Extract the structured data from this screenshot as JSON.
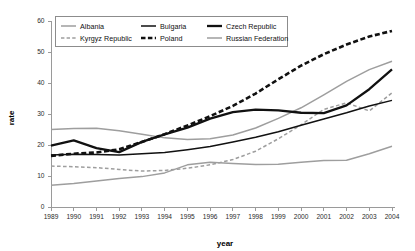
{
  "chart_data": {
    "type": "line",
    "title": "",
    "xlabel": "year",
    "ylabel": "rate",
    "grid": false,
    "legend_position": "top-inside",
    "xlim": [
      1989,
      2004
    ],
    "ylim": [
      0,
      60
    ],
    "x_ticks": [
      1989,
      1990,
      1991,
      1992,
      1993,
      1994,
      1995,
      1996,
      1997,
      1998,
      1999,
      2000,
      2001,
      2002,
      2003,
      2004
    ],
    "y_ticks": [
      0,
      10,
      20,
      30,
      40,
      50,
      60
    ],
    "x": [
      1989,
      1990,
      1991,
      1992,
      1993,
      1994,
      1995,
      1996,
      1997,
      1998,
      1999,
      2000,
      2001,
      2002,
      2003,
      2004
    ],
    "series": [
      {
        "name": "Albania",
        "style": "solid",
        "color": "#9e9e9e",
        "width": 1.5,
        "values": [
          25.0,
          25.3,
          25.4,
          24.6,
          23.5,
          22.3,
          21.8,
          22.0,
          23.2,
          25.5,
          28.6,
          32.0,
          36.2,
          40.5,
          44.3,
          47.0
        ]
      },
      {
        "name": "Kyrgyz Republic",
        "style": "dashed",
        "color": "#9e9e9e",
        "width": 1.5,
        "values": [
          13.2,
          13.0,
          12.7,
          12.1,
          11.6,
          11.8,
          12.5,
          13.6,
          15.3,
          18.0,
          22.0,
          26.5,
          31.5,
          33.6,
          31.0,
          36.8
        ]
      },
      {
        "name": "Bulgaria",
        "style": "solid",
        "color": "#111111",
        "width": 1.5,
        "values": [
          16.8,
          17.0,
          16.9,
          16.8,
          17.2,
          17.6,
          18.5,
          19.5,
          21.0,
          22.5,
          24.3,
          26.4,
          28.4,
          30.4,
          32.6,
          34.4
        ]
      },
      {
        "name": "Poland",
        "style": "dashed",
        "color": "#111111",
        "width": 2.6,
        "values": [
          16.5,
          17.2,
          17.6,
          18.6,
          21.0,
          23.5,
          26.3,
          29.3,
          32.6,
          36.6,
          41.2,
          45.6,
          49.3,
          52.4,
          55.0,
          56.8
        ]
      },
      {
        "name": "Czech Republic",
        "style": "solid",
        "color": "#111111",
        "width": 2.3,
        "values": [
          19.8,
          21.5,
          19.0,
          17.7,
          21.0,
          23.4,
          25.6,
          28.5,
          30.6,
          31.4,
          31.2,
          30.4,
          30.3,
          32.8,
          38.0,
          44.4
        ]
      },
      {
        "name": "Russian Federation",
        "style": "solid",
        "color": "#9e9e9e",
        "width": 1.5,
        "values": [
          7.0,
          7.6,
          8.4,
          9.2,
          9.8,
          11.0,
          13.6,
          14.4,
          14.0,
          13.7,
          13.8,
          14.4,
          15.0,
          15.1,
          17.2,
          19.6
        ]
      }
    ],
    "legend_entries": [
      {
        "label": "Albania",
        "style": "solid",
        "color": "#9e9e9e",
        "width": 1.5
      },
      {
        "label": "Bulgaria",
        "style": "solid",
        "color": "#111111",
        "width": 1.5
      },
      {
        "label": "Czech Republic",
        "style": "solid",
        "color": "#111111",
        "width": 2.3
      },
      {
        "label": "Kyrgyz Republic",
        "style": "dashed",
        "color": "#9e9e9e",
        "width": 1.5
      },
      {
        "label": "Poland",
        "style": "dashed",
        "color": "#111111",
        "width": 2.6
      },
      {
        "label": "Russian Federation",
        "style": "solid",
        "color": "#9e9e9e",
        "width": 1.5
      }
    ]
  }
}
